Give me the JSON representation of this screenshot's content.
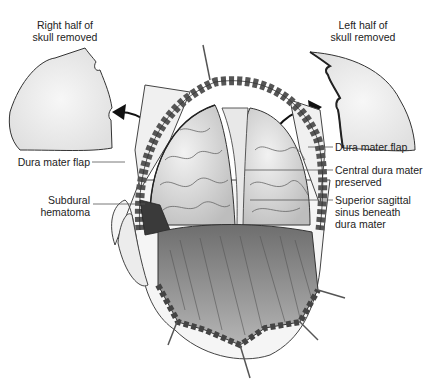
{
  "figure": {
    "labels": {
      "right_half_skull": [
        "Right half of",
        "skull removed"
      ],
      "left_half_skull": [
        "Left half of",
        "skull removed"
      ],
      "dura_flap_left": "Dura mater flap",
      "dura_flap_right": "Dura mater flap",
      "subdural_hematoma": [
        "Subdural",
        "hematoma"
      ],
      "central_dura": [
        "Central dura mater",
        "preserved"
      ],
      "superior_sagittal": [
        "Superior sagittal",
        "sinus beneath",
        "dura mater"
      ]
    },
    "colors": {
      "line": "#333333",
      "skull_fill": "#e6e6e6",
      "brain_fill": "#d8d8d8",
      "scalp_fill": "#8a8a8a",
      "hematoma": "#3a3a3a"
    }
  }
}
